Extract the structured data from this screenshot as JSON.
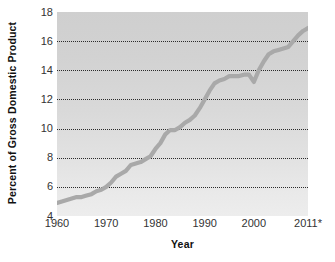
{
  "chart_data": {
    "type": "line",
    "title": "",
    "xlabel": "Year",
    "ylabel": "Percent of Gross Domestic Product",
    "xlim": [
      1960,
      2011
    ],
    "ylim": [
      4,
      18
    ],
    "grid": true,
    "legend": "none",
    "line_color": "#a9a9a9",
    "plot_background": "#dadada",
    "gridline_color": "#2b2b2b",
    "y_ticks": [
      "4",
      "6",
      "8",
      "10",
      "12",
      "14",
      "16",
      "18"
    ],
    "y_tick_values": [
      4,
      6,
      8,
      10,
      12,
      14,
      16,
      18
    ],
    "x_ticks": [
      "1960",
      "1970",
      "1980",
      "1990",
      "2000",
      "2011*"
    ],
    "x_tick_values": [
      1960,
      1970,
      1980,
      1990,
      2000,
      2011
    ],
    "x": [
      1960,
      1961,
      1962,
      1963,
      1964,
      1965,
      1966,
      1967,
      1968,
      1969,
      1970,
      1971,
      1972,
      1973,
      1974,
      1975,
      1976,
      1977,
      1978,
      1979,
      1980,
      1981,
      1982,
      1983,
      1984,
      1985,
      1986,
      1987,
      1988,
      1989,
      1990,
      1991,
      1992,
      1993,
      1994,
      1995,
      1996,
      1997,
      1998,
      1999,
      2000,
      2001,
      2002,
      2003,
      2004,
      2005,
      2006,
      2007,
      2008,
      2009,
      2010,
      2011
    ],
    "values": [
      4.9,
      5.0,
      5.1,
      5.2,
      5.3,
      5.3,
      5.4,
      5.5,
      5.7,
      5.8,
      6.0,
      6.3,
      6.7,
      6.9,
      7.1,
      7.5,
      7.6,
      7.7,
      7.9,
      8.1,
      8.6,
      9.0,
      9.6,
      9.9,
      9.9,
      10.1,
      10.4,
      10.6,
      10.9,
      11.4,
      12.0,
      12.6,
      13.1,
      13.3,
      13.4,
      13.6,
      13.6,
      13.6,
      13.7,
      13.7,
      13.2,
      14.0,
      14.6,
      15.1,
      15.3,
      15.4,
      15.5,
      15.6,
      16.0,
      16.4,
      16.7,
      16.9
    ],
    "series": [
      {
        "name": "Health expenditures as percent of GDP",
        "values": [
          4.9,
          5.0,
          5.1,
          5.2,
          5.3,
          5.3,
          5.4,
          5.5,
          5.7,
          5.8,
          6.0,
          6.3,
          6.7,
          6.9,
          7.1,
          7.5,
          7.6,
          7.7,
          7.9,
          8.1,
          8.6,
          9.0,
          9.6,
          9.9,
          9.9,
          10.1,
          10.4,
          10.6,
          10.9,
          11.4,
          12.0,
          12.6,
          13.1,
          13.3,
          13.4,
          13.6,
          13.6,
          13.6,
          13.7,
          13.7,
          13.2,
          14.0,
          14.6,
          15.1,
          15.3,
          15.4,
          15.5,
          15.6,
          16.0,
          16.4,
          16.7,
          16.9
        ]
      }
    ],
    "annotations": [
      "* indicates projected or preliminary value for 2011"
    ]
  }
}
